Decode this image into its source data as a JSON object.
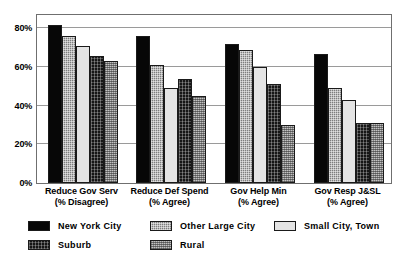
{
  "chart_data": {
    "type": "bar",
    "title": "",
    "subtitle": "",
    "xlabel": "",
    "ylabel": "",
    "ylim": [
      0,
      88
    ],
    "grid": true,
    "grid_values": [
      20,
      40,
      60,
      80
    ],
    "legend_position": "bottom-left",
    "categories": [
      "Reduce Gov Serv (% Disagree)",
      "Reduce Def Spend (% Agree)",
      "Gov Help Min (% Agree)",
      "Gov Resp J&SL (% Agree)"
    ],
    "category_lines": [
      {
        "line1": "Reduce Gov Serv",
        "line2": "(% Disagree)"
      },
      {
        "line1": "Reduce Def Spend",
        "line2": "(% Agree)"
      },
      {
        "line1": "Gov Help Min",
        "line2": "(% Agree)"
      },
      {
        "line1": "Gov Resp J&SL",
        "line2": "(% Agree)"
      }
    ],
    "tick_labels": [
      "0%",
      "20%",
      "40%",
      "60%",
      "80%"
    ],
    "tick_values": [
      0,
      20,
      40,
      60,
      80
    ],
    "series": [
      {
        "name": "New York City",
        "key": "nyc",
        "color": "#070707",
        "values": [
          82,
          76,
          72,
          67
        ]
      },
      {
        "name": "Other Large City",
        "key": "otherlarge",
        "color": "#7e7e7e",
        "values": [
          76,
          61,
          69,
          49
        ]
      },
      {
        "name": "Small City, Town",
        "key": "smallcity",
        "color": "#e4e4e4",
        "values": [
          71,
          49,
          60,
          43
        ]
      },
      {
        "name": "Suburb",
        "key": "suburb",
        "color": "#161616",
        "values": [
          66,
          54,
          51,
          31
        ]
      },
      {
        "name": "Rural",
        "key": "rural",
        "color": "#c2c2c2",
        "values": [
          63,
          45,
          30,
          31
        ]
      }
    ]
  },
  "legend": {
    "items": [
      {
        "label": "New York City",
        "key": "nyc"
      },
      {
        "label": "Other Large City",
        "key": "otherlarge"
      },
      {
        "label": "Small City, Town",
        "key": "smallcity"
      },
      {
        "label": "Suburb",
        "key": "suburb"
      },
      {
        "label": "Rural",
        "key": "rural"
      }
    ]
  }
}
